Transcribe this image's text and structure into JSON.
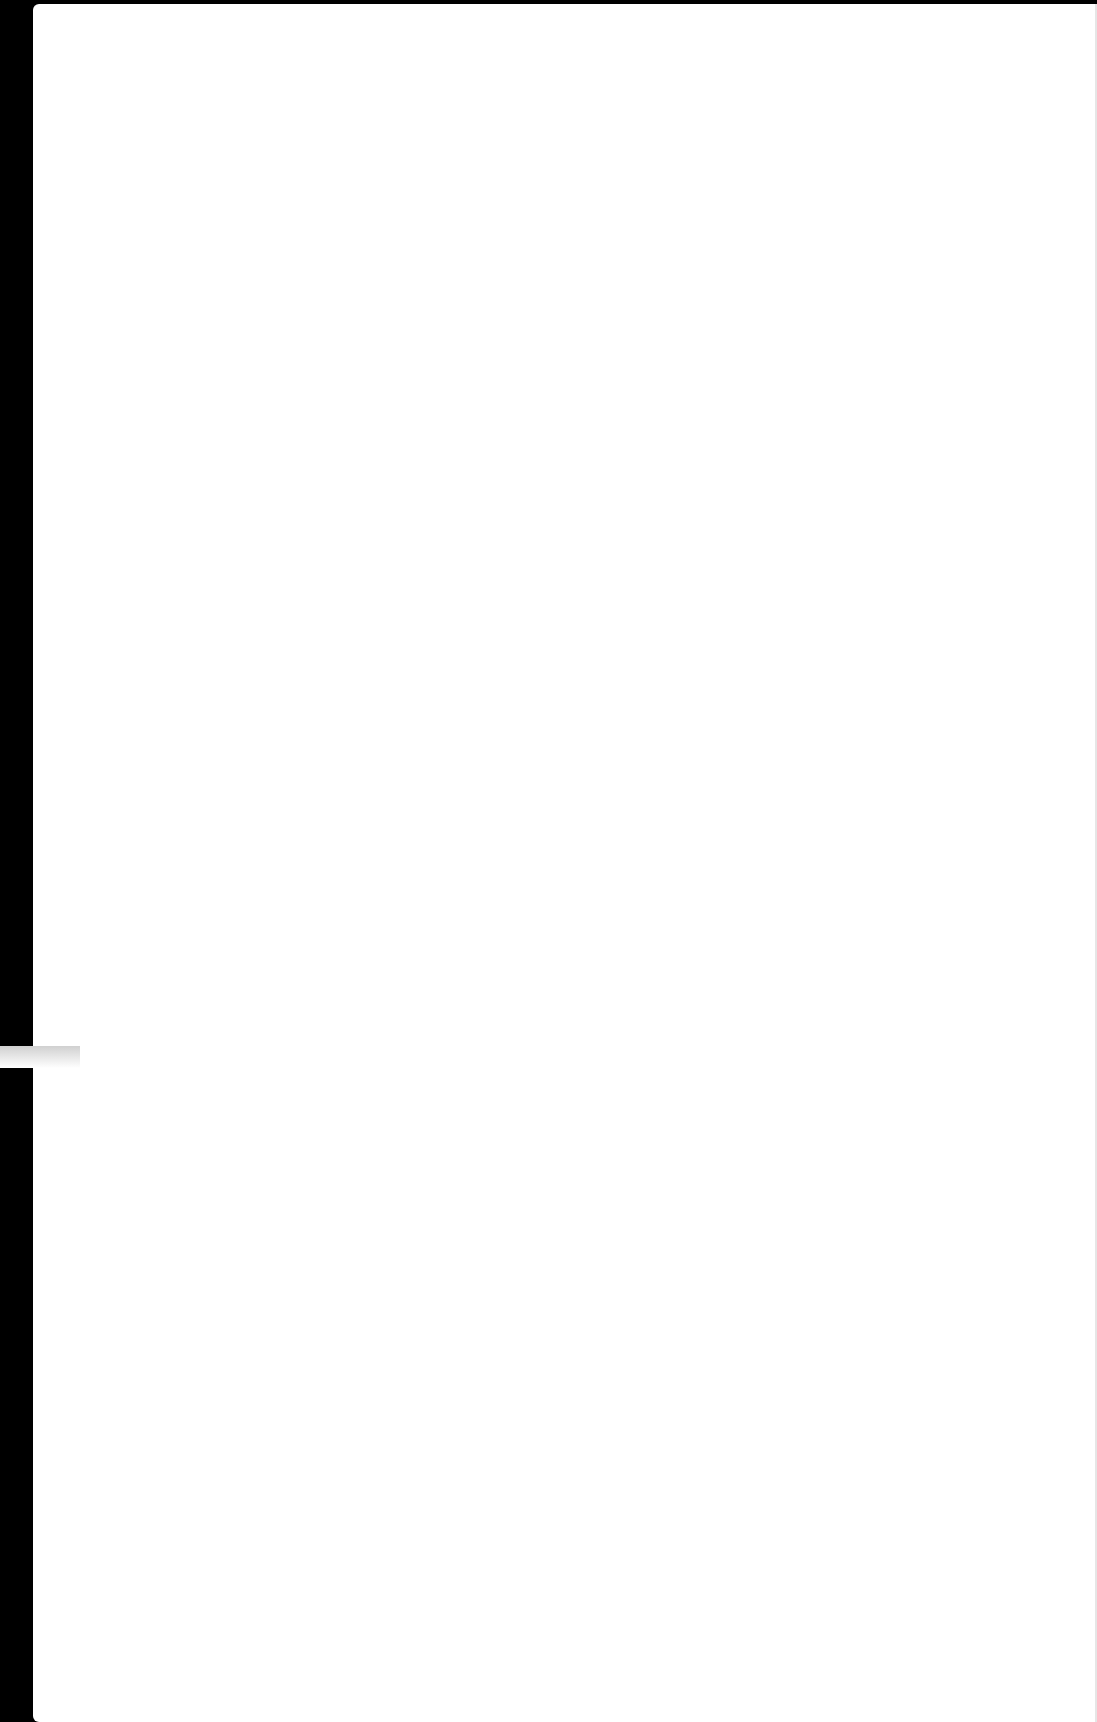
{
  "page": {
    "background": "#ffffff",
    "frame_color": "#000000",
    "content": ""
  }
}
